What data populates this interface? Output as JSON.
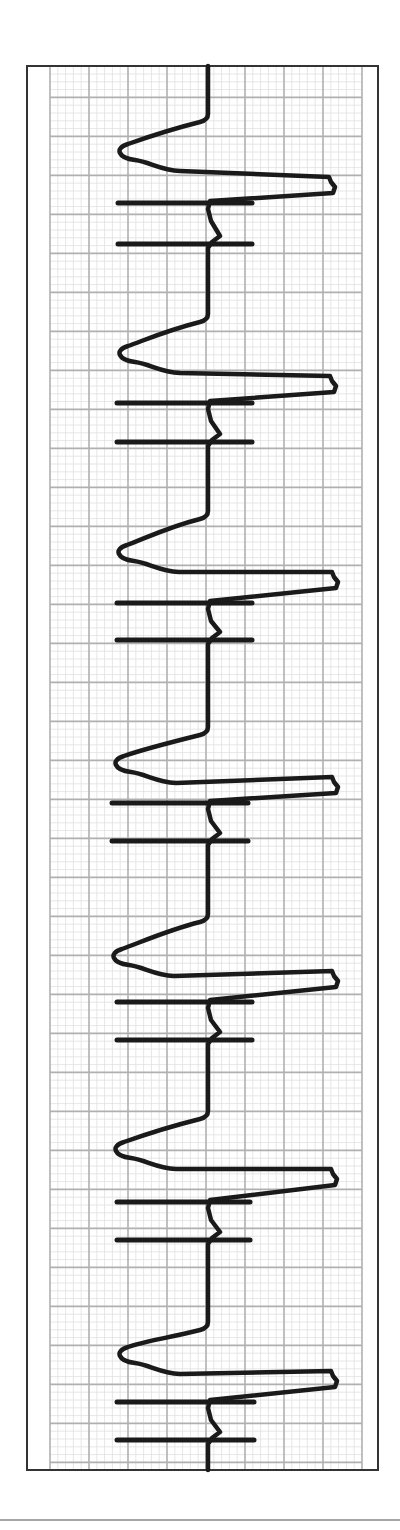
{
  "figure": {
    "type": "ecg-rhythm-strip",
    "orientation": "vertical",
    "description": "ECG rhythm strip (rotated 90°) showing 7 repeating wide complexes, each preceded by paired pacing-like spike markers",
    "beat_count": 7
  },
  "colors": {
    "background": "#ffffff",
    "frame": "#333333",
    "grid_major": "#b0b0b0",
    "grid_minor": "#e0e0e0",
    "trace": "#1a1a1a",
    "footer_rule": "#888888"
  },
  "layout": {
    "frame": {
      "x": 27,
      "y": 66,
      "w": 351,
      "h": 404
    },
    "grid": {
      "x0": 50,
      "x1": 362,
      "y0": 66,
      "y1": 1470,
      "major": 39,
      "minor_per_major": 5
    },
    "baseline_x": 208,
    "footer_rule_y": 1520
  },
  "beats": [
    {
      "onset_y": 120,
      "trough_x": 120,
      "trough_y": 150,
      "peak_x": 335,
      "peak_y": 193,
      "spike1_y": 203,
      "spike2_y": 244,
      "spike_x0": 118,
      "spike_x1": 252
    },
    {
      "onset_y": 320,
      "trough_x": 120,
      "trough_y": 352,
      "peak_x": 336,
      "peak_y": 392,
      "spike1_y": 403,
      "spike2_y": 442,
      "spike_x0": 117,
      "spike_x1": 252
    },
    {
      "onset_y": 517,
      "trough_x": 119,
      "trough_y": 551,
      "peak_x": 338,
      "peak_y": 588,
      "spike1_y": 603,
      "spike2_y": 640,
      "spike_x0": 117,
      "spike_x1": 252
    },
    {
      "onset_y": 733,
      "trough_x": 116,
      "trough_y": 762,
      "peak_x": 338,
      "peak_y": 793,
      "spike1_y": 803,
      "spike2_y": 841,
      "spike_x0": 112,
      "spike_x1": 248
    },
    {
      "onset_y": 920,
      "trough_x": 114,
      "trough_y": 955,
      "peak_x": 338,
      "peak_y": 987,
      "spike1_y": 1002,
      "spike2_y": 1040,
      "spike_x0": 117,
      "spike_x1": 252
    },
    {
      "onset_y": 1117,
      "trough_x": 116,
      "trough_y": 1148,
      "peak_x": 337,
      "peak_y": 1185,
      "spike1_y": 1202,
      "spike2_y": 1240,
      "spike_x0": 117,
      "spike_x1": 250
    },
    {
      "onset_y": 1328,
      "trough_x": 120,
      "trough_y": 1353,
      "peak_x": 337,
      "peak_y": 1387,
      "spike1_y": 1402,
      "spike2_y": 1440,
      "spike_x0": 117,
      "spike_x1": 254
    }
  ]
}
